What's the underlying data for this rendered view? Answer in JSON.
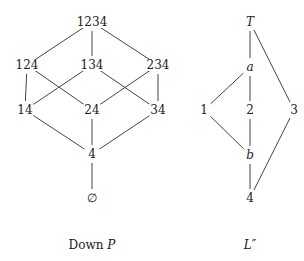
{
  "left_diagram": {
    "caption": "Down",
    "caption_var": "P",
    "nodes": [
      {
        "id": "1234",
        "label": "1234",
        "x": 92,
        "y": 22
      },
      {
        "id": "124",
        "label": "124",
        "x": 27,
        "y": 65
      },
      {
        "id": "134",
        "label": "134",
        "x": 92,
        "y": 65
      },
      {
        "id": "234",
        "label": "234",
        "x": 158,
        "y": 65
      },
      {
        "id": "14",
        "label": "14",
        "x": 25,
        "y": 110
      },
      {
        "id": "24",
        "label": "24",
        "x": 92,
        "y": 110
      },
      {
        "id": "34",
        "label": "34",
        "x": 158,
        "y": 110
      },
      {
        "id": "4",
        "label": "4",
        "x": 92,
        "y": 154
      },
      {
        "id": "empty",
        "label": "∅",
        "x": 92,
        "y": 198
      }
    ],
    "edges": [
      [
        "1234",
        "124"
      ],
      [
        "1234",
        "134"
      ],
      [
        "1234",
        "234"
      ],
      [
        "124",
        "14"
      ],
      [
        "124",
        "24"
      ],
      [
        "134",
        "14"
      ],
      [
        "134",
        "34"
      ],
      [
        "234",
        "24"
      ],
      [
        "234",
        "34"
      ],
      [
        "14",
        "4"
      ],
      [
        "24",
        "4"
      ],
      [
        "34",
        "4"
      ],
      [
        "4",
        "empty"
      ]
    ]
  },
  "right_diagram": {
    "caption": "L″",
    "nodes": [
      {
        "id": "T",
        "label": "T",
        "x": 250,
        "y": 22,
        "italic": true
      },
      {
        "id": "a",
        "label": "a",
        "x": 250,
        "y": 67,
        "italic": true
      },
      {
        "id": "1",
        "label": "1",
        "x": 204,
        "y": 110
      },
      {
        "id": "2",
        "label": "2",
        "x": 250,
        "y": 110
      },
      {
        "id": "3",
        "label": "3",
        "x": 294,
        "y": 110
      },
      {
        "id": "b",
        "label": "b",
        "x": 250,
        "y": 155,
        "italic": true
      },
      {
        "id": "4",
        "label": "4",
        "x": 250,
        "y": 198
      }
    ],
    "edges": [
      [
        "T",
        "a"
      ],
      [
        "T",
        "3"
      ],
      [
        "a",
        "1"
      ],
      [
        "a",
        "2"
      ],
      [
        "1",
        "b"
      ],
      [
        "2",
        "b"
      ],
      [
        "b",
        "4"
      ],
      [
        "3",
        "4"
      ]
    ]
  },
  "colors": {
    "line": "#444444",
    "text": "#222222"
  }
}
